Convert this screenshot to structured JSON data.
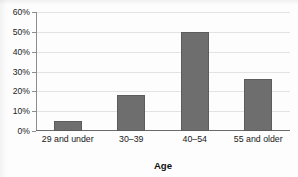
{
  "chart_data": {
    "type": "bar",
    "title": "",
    "title_note": "title clipped at top edge of image, illegible",
    "categories": [
      "29 and under",
      "30–39",
      "40–54",
      "55 and older"
    ],
    "values": [
      5,
      18,
      50,
      26
    ],
    "xlabel": "Age",
    "ylabel": "",
    "ylim": [
      0,
      60
    ],
    "ytick_values": [
      0,
      10,
      20,
      30,
      40,
      50,
      60
    ],
    "ytick_labels": [
      "0%",
      "10%",
      "20%",
      "30%",
      "40%",
      "50%",
      "60%"
    ],
    "grid": true,
    "legend": null,
    "bar_color": "#6e6e6e",
    "gridline_color": "#e3e3e3",
    "axis_color": "#6b6b6b"
  }
}
